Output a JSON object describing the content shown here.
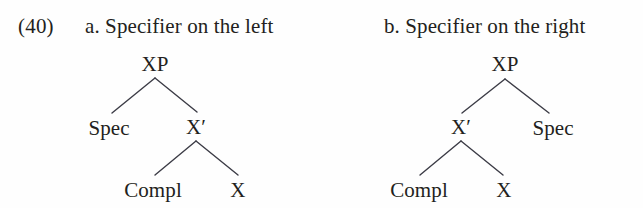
{
  "figure": {
    "example_number": "(40)",
    "background_color": "#fefefe",
    "line_color": "#3c3c46",
    "text_color": "#231f20"
  },
  "panels": [
    {
      "id": "a",
      "caption": "a. Specifier on the left",
      "tree": {
        "root": "XP",
        "order": "spec-left",
        "nodes": [
          {
            "name": "XP",
            "label": "XP",
            "x": 155,
            "y": 52,
            "level": 0
          },
          {
            "name": "Spec",
            "label": "Spec",
            "x": 109,
            "y": 116,
            "level": 1
          },
          {
            "name": "Xbar",
            "label": "X′",
            "x": 196,
            "y": 115,
            "level": 1
          },
          {
            "name": "Compl",
            "label": "Compl",
            "x": 153,
            "y": 178,
            "level": 2
          },
          {
            "name": "X",
            "label": "X",
            "x": 238,
            "y": 178,
            "level": 2
          }
        ],
        "edges": [
          {
            "from": "XP",
            "to": "Spec",
            "x1": 155,
            "y1": 78,
            "x2": 112,
            "y2": 113
          },
          {
            "from": "XP",
            "to": "Xbar",
            "x1": 155,
            "y1": 78,
            "x2": 197,
            "y2": 112
          },
          {
            "from": "Xbar",
            "to": "Compl",
            "x1": 196,
            "y1": 141,
            "x2": 155,
            "y2": 175
          },
          {
            "from": "Xbar",
            "to": "X",
            "x1": 196,
            "y1": 141,
            "x2": 238,
            "y2": 175
          }
        ]
      }
    },
    {
      "id": "b",
      "caption": "b. Specifier on the right",
      "tree": {
        "root": "XP",
        "order": "spec-right",
        "nodes": [
          {
            "name": "XP",
            "label": "XP",
            "x": 505,
            "y": 52,
            "level": 0
          },
          {
            "name": "Xbar",
            "label": "X′",
            "x": 461,
            "y": 115,
            "level": 1
          },
          {
            "name": "Spec",
            "label": "Spec",
            "x": 553,
            "y": 116,
            "level": 1
          },
          {
            "name": "Compl",
            "label": "Compl",
            "x": 419,
            "y": 178,
            "level": 2
          },
          {
            "name": "X",
            "label": "X",
            "x": 504,
            "y": 178,
            "level": 2
          }
        ],
        "edges": [
          {
            "from": "XP",
            "to": "Xbar",
            "x1": 505,
            "y1": 79,
            "x2": 462,
            "y2": 113
          },
          {
            "from": "XP",
            "to": "Spec",
            "x1": 505,
            "y1": 79,
            "x2": 549,
            "y2": 113
          },
          {
            "from": "Xbar",
            "to": "Compl",
            "x1": 461,
            "y1": 141,
            "x2": 420,
            "y2": 175
          },
          {
            "from": "Xbar",
            "to": "X",
            "x1": 461,
            "y1": 141,
            "x2": 503,
            "y2": 175
          }
        ]
      }
    }
  ]
}
